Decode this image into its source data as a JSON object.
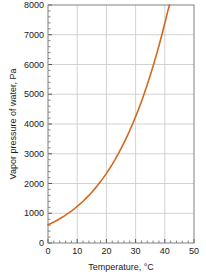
{
  "chart_data": {
    "type": "line",
    "title": "",
    "xlabel": "Temperature, °C",
    "ylabel": "Vapor pressure of water, Pa",
    "xlim": [
      0,
      50
    ],
    "ylim": [
      0,
      8000
    ],
    "xticks": [
      0,
      10,
      20,
      30,
      40,
      50
    ],
    "yticks": [
      0,
      1000,
      2000,
      3000,
      4000,
      5000,
      6000,
      7000,
      8000
    ],
    "xtick_labels": [
      "0",
      "10",
      "20",
      "30",
      "40",
      "50"
    ],
    "ytick_labels": [
      "0",
      "1000",
      "2000",
      "3000",
      "4000",
      "5000",
      "6000",
      "7000",
      "8000"
    ],
    "x_minor_interval": 2,
    "y_minor_interval": 200,
    "grid": true,
    "grid_color": "#c8c8c8",
    "axis_color": "#808080",
    "legend": null,
    "series": [
      {
        "name": "Saturation vapor pressure of water",
        "color": "#d2691e",
        "line_width": 1.6,
        "x": [
          0,
          1,
          2,
          3,
          4,
          5,
          6,
          7,
          8,
          9,
          10,
          11,
          12,
          13,
          14,
          15,
          16,
          17,
          18,
          19,
          20,
          21,
          22,
          23,
          24,
          25,
          26,
          27,
          28,
          29,
          30,
          31,
          32,
          33,
          34,
          35,
          36,
          37,
          38,
          39,
          40,
          41,
          41.6
        ],
        "values": [
          611,
          657,
          706,
          758,
          813,
          872,
          935,
          1002,
          1073,
          1148,
          1228,
          1313,
          1403,
          1498,
          1599,
          1706,
          1819,
          1938,
          2064,
          2198,
          2339,
          2488,
          2645,
          2810,
          2985,
          3169,
          3363,
          3567,
          3782,
          4008,
          4246,
          4495,
          4758,
          5034,
          5324,
          5628,
          5947,
          6282,
          6633,
          7001,
          7385,
          7787,
          8000
        ]
      }
    ]
  }
}
